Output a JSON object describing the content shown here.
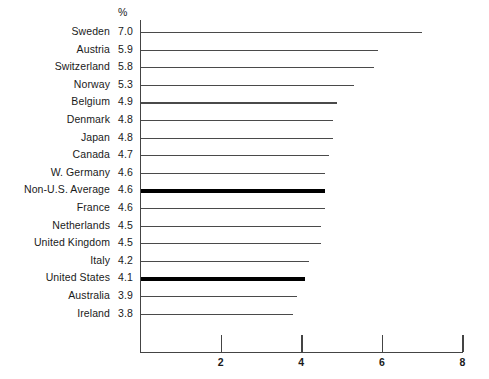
{
  "chart_data": {
    "type": "bar",
    "orientation": "horizontal",
    "title": "",
    "subtitle": "",
    "xlabel": "",
    "ylabel": "",
    "value_header": "%",
    "xlim": [
      0,
      8
    ],
    "xticks": [
      2,
      4,
      6,
      8
    ],
    "xtick_labels": [
      "2",
      "4",
      "6",
      "8"
    ],
    "grid": false,
    "legend": "none",
    "categories": [
      "Sweden",
      "Austria",
      "Switzerland",
      "Norway",
      "Belgium",
      "Denmark",
      "Japan",
      "Canada",
      "W. Germany",
      "Non-U.S. Average",
      "France",
      "Netherlands",
      "United Kingdom",
      "Italy",
      "United States",
      "Australia",
      "Ireland"
    ],
    "values": [
      7.0,
      5.9,
      5.8,
      5.3,
      4.9,
      4.8,
      4.8,
      4.7,
      4.6,
      4.6,
      4.6,
      4.5,
      4.5,
      4.2,
      4.1,
      3.9,
      3.8
    ],
    "value_labels": [
      "7.0",
      "5.9",
      "5.8",
      "5.3",
      "4.9",
      "4.8",
      "4.8",
      "4.7",
      "4.6",
      "4.6",
      "4.6",
      "4.5",
      "4.5",
      "4.2",
      "4.1",
      "3.9",
      "3.8"
    ],
    "highlighted": [
      "Non-U.S. Average",
      "United States"
    ],
    "colors": {
      "bar": "#4a4a4a",
      "bar_highlight": "#000000",
      "axis": "#444444",
      "text": "#1a1a1a",
      "background": "#ffffff"
    }
  }
}
